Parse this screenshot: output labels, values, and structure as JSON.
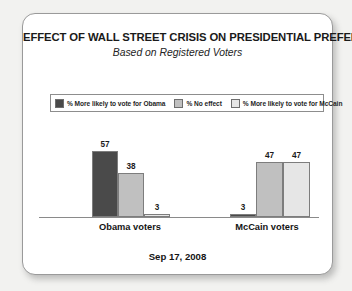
{
  "card": {
    "title": "EFFECT OF WALL STREET CRISIS ON PRESIDENTIAL PREFERENCE",
    "subtitle": "Based on Registered Voters",
    "footer_date": "Sep 17, 2008"
  },
  "legend": {
    "items": [
      {
        "label": "% More likely to vote for Obama",
        "color": "#4a4a4a",
        "swatch_icon": "legend-swatch-icon"
      },
      {
        "label": "% No effect",
        "color": "#c0c0c0",
        "swatch_icon": "legend-swatch-icon"
      },
      {
        "label": "% More likely to vote for McCain",
        "color": "#e6e6e6",
        "swatch_icon": "legend-swatch-icon"
      }
    ]
  },
  "chart_data": {
    "type": "bar",
    "title": "EFFECT OF WALL STREET CRISIS ON PRESIDENTIAL PREFERENCE",
    "subtitle": "Based on Registered Voters",
    "xlabel": "",
    "ylabel": "",
    "ylim": [
      0,
      60
    ],
    "grid": false,
    "legend_position": "top",
    "categories": [
      "Obama voters",
      "McCain voters"
    ],
    "series": [
      {
        "name": "% More likely to vote for Obama",
        "color": "#4a4a4a",
        "values": [
          57,
          3
        ]
      },
      {
        "name": "% No effect",
        "color": "#c0c0c0",
        "values": [
          38,
          47
        ]
      },
      {
        "name": "% More likely to vote for McCain",
        "color": "#e6e6e6",
        "values": [
          3,
          47
        ]
      }
    ],
    "annotations": [
      "Sep 17, 2008"
    ]
  },
  "bars": [
    {
      "value": "57",
      "value_num": 57,
      "group": 0,
      "series": 0,
      "color": "#4a4a4a",
      "left": 53,
      "width": 26
    },
    {
      "value": "38",
      "value_num": 38,
      "group": 0,
      "series": 1,
      "color": "#c0c0c0",
      "left": 79,
      "width": 26
    },
    {
      "value": "3",
      "value_num": 3,
      "group": 0,
      "series": 2,
      "color": "#e6e6e6",
      "left": 105,
      "width": 26
    },
    {
      "value": "3",
      "value_num": 3,
      "group": 1,
      "series": 0,
      "color": "#4a4a4a",
      "left": 191,
      "width": 26
    },
    {
      "value": "47",
      "value_num": 47,
      "group": 1,
      "series": 1,
      "color": "#c0c0c0",
      "left": 217,
      "width": 27
    },
    {
      "value": "47",
      "value_num": 47,
      "group": 1,
      "series": 2,
      "color": "#e6e6e6",
      "left": 244,
      "width": 27
    }
  ]
}
